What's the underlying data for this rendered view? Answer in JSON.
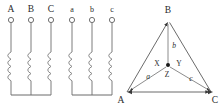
{
  "diagram": {
    "colors": {
      "background": "#ffffff",
      "wire": "#7d7d7d",
      "coil": "#8a8a8a",
      "vector": "#5a5a5a",
      "label": "#2b2b2b",
      "node_dot": "#1a1a1a"
    },
    "primary_winding": {
      "name": "primary-wye-winding",
      "terminals": [
        {
          "label": "A",
          "x": 11
        },
        {
          "label": "B",
          "x": 31
        },
        {
          "label": "C",
          "x": 51
        }
      ],
      "coil_count": 3,
      "connection": "wye"
    },
    "secondary_winding": {
      "name": "secondary-wye-winding",
      "terminals": [
        {
          "label": "a",
          "x": 72
        },
        {
          "label": "b",
          "x": 92
        },
        {
          "label": "c",
          "x": 112
        }
      ],
      "coil_count": 3,
      "connection": "wye"
    },
    "phasor": {
      "name": "phasor-triangle",
      "vertices": [
        {
          "label": "A",
          "x": 127,
          "y": 92,
          "label_x": 120,
          "label_y": 102
        },
        {
          "label": "B",
          "x": 169,
          "y": 20,
          "label_x": 166,
          "label_y": 13
        },
        {
          "label": "C",
          "x": 213,
          "y": 92,
          "label_x": 213,
          "label_y": 102
        }
      ],
      "center": {
        "label": "Z",
        "x": 168,
        "y": 66
      },
      "node_labels": [
        {
          "label": "X",
          "x": 156,
          "y": 66
        },
        {
          "label": "Y",
          "x": 175,
          "y": 66
        },
        {
          "label": "Z",
          "x": 167,
          "y": 76
        }
      ],
      "phasor_labels": [
        {
          "label": "a",
          "x": 148,
          "y": 78
        },
        {
          "label": "b",
          "x": 173,
          "y": 47
        },
        {
          "label": "c",
          "x": 190,
          "y": 80
        }
      ]
    }
  }
}
